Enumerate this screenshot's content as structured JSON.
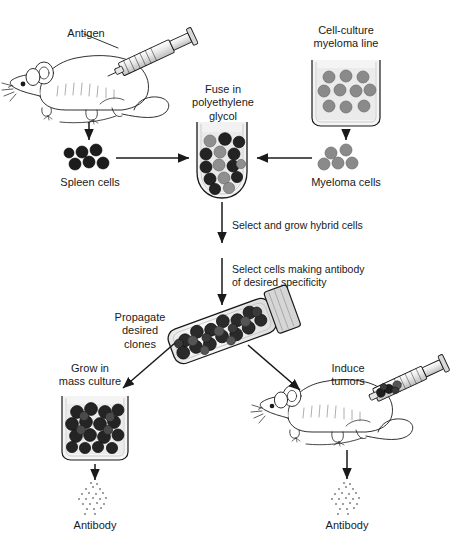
{
  "diagram": {
    "background_color": "#ffffff",
    "ink_color": "#1a1a1a",
    "cell_colors": {
      "spleen_cell": "#1c1c1c",
      "myeloma_cell": "#8a8a8a",
      "hybrid_cell_dark": "#232323",
      "hybrid_cell_gray": "#8f8f8f",
      "glassware_fill": "#efefef",
      "antibody_stipple": "#7a7a7a"
    }
  },
  "labels": {
    "antigen": "Antigen",
    "cell_culture_myeloma_line": "Cell-culture\nmyeloma line",
    "fuse_in_peg": "Fuse in\npolyethylene\nglycol",
    "spleen_cells": "Spleen cells",
    "myeloma_cells": "Myeloma cells",
    "select_grow_hybrid": "Select and grow hybrid cells",
    "select_antibody_specificity": "Select cells making antibody\nof desired specificity",
    "propagate_desired_clones": "Propagate\ndesired\nclones",
    "grow_in_mass_culture": "Grow in\nmass culture",
    "induce_tumors": "Induce\ntumors",
    "antibody_left": "Antibody",
    "antibody_right": "Antibody"
  },
  "cell_counts": {
    "myeloma_flask": 10,
    "spleen_cluster": 6,
    "myeloma_cluster": 6,
    "fusion_tube": 15,
    "clone_tube": 22,
    "mass_culture_beaker": 20
  },
  "flow_steps": [
    "Inject antigen into mouse",
    "Harvest spleen cells",
    "Culture myeloma line",
    "Harvest myeloma cells",
    "Fuse in polyethylene glycol",
    "Select and grow hybrid cells",
    "Select cells making antibody of desired specificity",
    "Propagate desired clones",
    "Grow in mass culture or induce tumors",
    "Collect antibody"
  ]
}
